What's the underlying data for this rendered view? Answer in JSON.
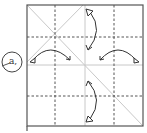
{
  "diagram": {
    "type": "origami-fold-diagram",
    "step_label": "a,",
    "square": {
      "x": 27,
      "y": 5,
      "size": 116
    },
    "grid": {
      "dashed_vertical_x": [
        55,
        114
      ],
      "dashed_horizontal_y": [
        37,
        96
      ],
      "solid_center_vertical_x": 85,
      "solid_center_horizontal_y": 65
    },
    "creases": [
      {
        "from": [
          27,
          5
        ],
        "to": [
          143,
          126
        ],
        "style": "solid-light"
      },
      {
        "from": [
          83,
          5
        ],
        "to": [
          27,
          62
        ],
        "style": "solid-light"
      }
    ],
    "arrows": [
      {
        "name": "top-fold-arrow",
        "direction": "down"
      },
      {
        "name": "left-fold-arrow",
        "direction": "right"
      },
      {
        "name": "right-fold-arrow",
        "direction": "left"
      },
      {
        "name": "bottom-fold-arrow",
        "direction": "up"
      }
    ],
    "colors": {
      "border": "#555555",
      "dashed": "#555555",
      "crease": "#c8c8c8",
      "arrow": "#333333"
    }
  }
}
